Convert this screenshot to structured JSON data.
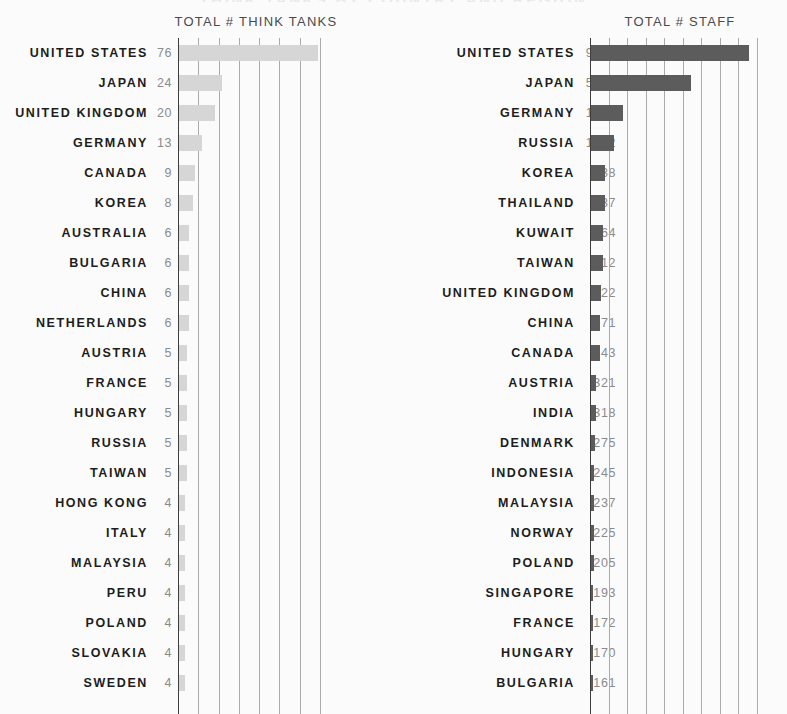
{
  "page": {
    "headline": "THINK TANKS BY COUNTRY AND REGION"
  },
  "charts": {
    "left": {
      "title": "TOTAL # THINK TANKS",
      "axis_max": 88,
      "gridline_count": 8,
      "bar_color": "#d6d6d6",
      "rows": [
        {
          "label": "UNITED STATES",
          "value": "76",
          "n": 76
        },
        {
          "label": "JAPAN",
          "value": "24",
          "n": 24
        },
        {
          "label": "UNITED KINGDOM",
          "value": "20",
          "n": 20
        },
        {
          "label": "GERMANY",
          "value": "13",
          "n": 13
        },
        {
          "label": "CANADA",
          "value": "9",
          "n": 9
        },
        {
          "label": "KOREA",
          "value": "8",
          "n": 8
        },
        {
          "label": "AUSTRALIA",
          "value": "6",
          "n": 6
        },
        {
          "label": "BULGARIA",
          "value": "6",
          "n": 6
        },
        {
          "label": "CHINA",
          "value": "6",
          "n": 6
        },
        {
          "label": "NETHERLANDS",
          "value": "6",
          "n": 6
        },
        {
          "label": "AUSTRIA",
          "value": "5",
          "n": 5
        },
        {
          "label": "FRANCE",
          "value": "5",
          "n": 5
        },
        {
          "label": "HUNGARY",
          "value": "5",
          "n": 5
        },
        {
          "label": "RUSSIA",
          "value": "5",
          "n": 5
        },
        {
          "label": "TAIWAN",
          "value": "5",
          "n": 5
        },
        {
          "label": "HONG KONG",
          "value": "4",
          "n": 4
        },
        {
          "label": "ITALY",
          "value": "4",
          "n": 4
        },
        {
          "label": "MALAYSIA",
          "value": "4",
          "n": 4
        },
        {
          "label": "PERU",
          "value": "4",
          "n": 4
        },
        {
          "label": "POLAND",
          "value": "4",
          "n": 4
        },
        {
          "label": "SLOVAKIA",
          "value": "4",
          "n": 4
        },
        {
          "label": "SWEDEN",
          "value": "4",
          "n": 4
        }
      ]
    },
    "right": {
      "title": "TOTAL # STAFF",
      "axis_max": 10500,
      "gridline_count": 10,
      "bar_color": "#5c5c5c",
      "rows": [
        {
          "label": "UNITED STATES",
          "value": "9032",
          "n": 9032
        },
        {
          "label": "JAPAN",
          "value": "5709",
          "n": 5709
        },
        {
          "label": "GERMANY",
          "value": "1875",
          "n": 1875
        },
        {
          "label": "RUSSIA",
          "value": "1342",
          "n": 1342
        },
        {
          "label": "KOREA",
          "value": "838",
          "n": 838
        },
        {
          "label": "THAILAND",
          "value": "837",
          "n": 837
        },
        {
          "label": "KUWAIT",
          "value": "764",
          "n": 764
        },
        {
          "label": "TAIWAN",
          "value": "712",
          "n": 712
        },
        {
          "label": "UNITED KINGDOM",
          "value": "622",
          "n": 622
        },
        {
          "label": "CHINA",
          "value": "571",
          "n": 571
        },
        {
          "label": "CANADA",
          "value": "543",
          "n": 543
        },
        {
          "label": "AUSTRIA",
          "value": "321",
          "n": 321
        },
        {
          "label": "INDIA",
          "value": "318",
          "n": 318
        },
        {
          "label": "DENMARK",
          "value": "275",
          "n": 275
        },
        {
          "label": "INDONESIA",
          "value": "245",
          "n": 245
        },
        {
          "label": "MALAYSIA",
          "value": "237",
          "n": 237
        },
        {
          "label": "NORWAY",
          "value": "225",
          "n": 225
        },
        {
          "label": "POLAND",
          "value": "205",
          "n": 205
        },
        {
          "label": "SINGAPORE",
          "value": "193",
          "n": 193
        },
        {
          "label": "FRANCE",
          "value": "172",
          "n": 172
        },
        {
          "label": "HUNGARY",
          "value": "170",
          "n": 170
        },
        {
          "label": "BULGARIA",
          "value": "161",
          "n": 161
        }
      ]
    }
  },
  "chart_data": [
    {
      "type": "bar",
      "orientation": "horizontal",
      "title": "TOTAL # THINK TANKS",
      "xlabel": "",
      "ylabel": "",
      "xlim": [
        0,
        88
      ],
      "grid": true,
      "gridlines": 8,
      "legend": "none",
      "bar_color": "#d6d6d6",
      "categories": [
        "UNITED STATES",
        "JAPAN",
        "UNITED KINGDOM",
        "GERMANY",
        "CANADA",
        "KOREA",
        "AUSTRALIA",
        "BULGARIA",
        "CHINA",
        "NETHERLANDS",
        "AUSTRIA",
        "FRANCE",
        "HUNGARY",
        "RUSSIA",
        "TAIWAN",
        "HONG KONG",
        "ITALY",
        "MALAYSIA",
        "PERU",
        "POLAND",
        "SLOVAKIA",
        "SWEDEN"
      ],
      "values": [
        76,
        24,
        20,
        13,
        9,
        8,
        6,
        6,
        6,
        6,
        5,
        5,
        5,
        5,
        5,
        4,
        4,
        4,
        4,
        4,
        4,
        4
      ]
    },
    {
      "type": "bar",
      "orientation": "horizontal",
      "title": "TOTAL # STAFF",
      "xlabel": "",
      "ylabel": "",
      "xlim": [
        0,
        10500
      ],
      "grid": true,
      "gridlines": 10,
      "legend": "none",
      "bar_color": "#5c5c5c",
      "categories": [
        "UNITED STATES",
        "JAPAN",
        "GERMANY",
        "RUSSIA",
        "KOREA",
        "THAILAND",
        "KUWAIT",
        "TAIWAN",
        "UNITED KINGDOM",
        "CHINA",
        "CANADA",
        "AUSTRIA",
        "INDIA",
        "DENMARK",
        "INDONESIA",
        "MALAYSIA",
        "NORWAY",
        "POLAND",
        "SINGAPORE",
        "FRANCE",
        "HUNGARY",
        "BULGARIA"
      ],
      "values": [
        9032,
        5709,
        1875,
        1342,
        838,
        837,
        764,
        712,
        622,
        571,
        543,
        321,
        318,
        275,
        245,
        237,
        225,
        205,
        193,
        172,
        170,
        161
      ]
    }
  ]
}
